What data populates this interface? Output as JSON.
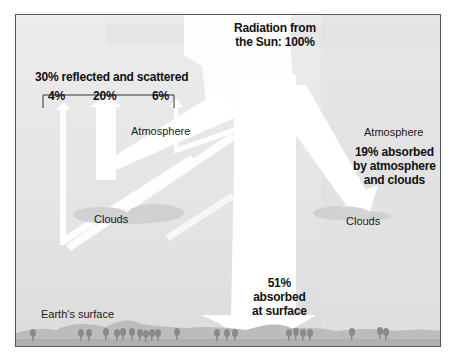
{
  "diagram": {
    "title_watermark": "SUNDIAL ENERGY BUDGET",
    "source": {
      "label_line1": "Radiation from",
      "label_line2": "the Sun: 100%"
    },
    "reflected": {
      "label": "30% reflected and scattered",
      "parts": [
        {
          "value": "4%",
          "from": "Earth's surface"
        },
        {
          "value": "20%",
          "from": "Clouds"
        },
        {
          "value": "6%",
          "from": "Atmosphere"
        }
      ]
    },
    "absorbed_atmosphere": {
      "line1": "19% absorbed",
      "line2": "by atmosphere",
      "line3": "and clouds"
    },
    "absorbed_surface": {
      "line1": "51%",
      "line2": "absorbed",
      "line3": "at surface"
    },
    "labels": {
      "atmosphere_left": "Atmosphere",
      "atmosphere_right": "Atmosphere",
      "clouds_left": "Clouds",
      "clouds_right": "Clouds",
      "earth_surface": "Earth's surface"
    },
    "colors": {
      "background": "#e6e6e6",
      "arrow": "#ffffff",
      "ground": "#b4b4b4",
      "trees": "#8a8a8a",
      "clouds": "#cfcfcf",
      "border": "#5a5a5a",
      "text": "#111111"
    }
  }
}
